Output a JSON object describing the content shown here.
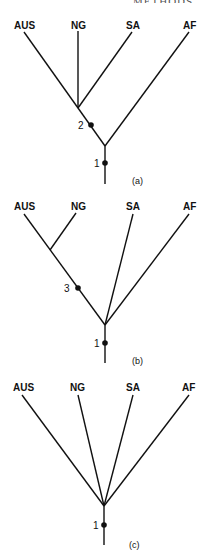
{
  "header": {
    "fragment_text": "METHODS"
  },
  "taxa": [
    "AUS",
    "NG",
    "SA",
    "AF"
  ],
  "trees": [
    {
      "id": "a",
      "caption": "(a)",
      "topology": "(((AUS,NG,SA),AF))",
      "markers": [
        {
          "label": "2",
          "position": "on branch below AUS/NG/SA node"
        },
        {
          "label": "1",
          "position": "on root stem"
        }
      ]
    },
    {
      "id": "b",
      "caption": "(b)",
      "topology": "((AUS,NG),SA,AF)",
      "markers": [
        {
          "label": "3",
          "position": "on branch below AUS/NG node"
        },
        {
          "label": "1",
          "position": "on root stem"
        }
      ]
    },
    {
      "id": "c",
      "caption": "(c)",
      "topology": "(AUS,NG,SA,AF)",
      "markers": [
        {
          "label": "1",
          "position": "on root stem"
        }
      ]
    }
  ]
}
